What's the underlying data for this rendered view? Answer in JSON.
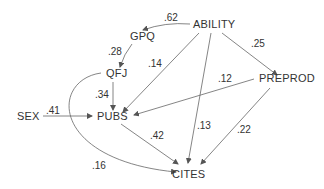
{
  "diagram": {
    "type": "path-diagram",
    "nodes": [
      {
        "id": "ability",
        "label": "ABILITY"
      },
      {
        "id": "gpq",
        "label": "GPQ"
      },
      {
        "id": "qfj",
        "label": "QFJ"
      },
      {
        "id": "preprod",
        "label": "PREPROD"
      },
      {
        "id": "sex",
        "label": "SEX"
      },
      {
        "id": "pubs",
        "label": "PUBS"
      },
      {
        "id": "cites",
        "label": "CITES"
      }
    ],
    "edges": [
      {
        "from": "ABILITY",
        "to": "GPQ",
        "coef": ".62"
      },
      {
        "from": "GPQ",
        "to": "QFJ",
        "coef": ".28"
      },
      {
        "from": "ABILITY",
        "to": "PUBS",
        "coef": ".14"
      },
      {
        "from": "ABILITY",
        "to": "PREPROD",
        "coef": ".25"
      },
      {
        "from": "QFJ",
        "to": "PUBS",
        "coef": ".34"
      },
      {
        "from": "PREPROD",
        "to": "PUBS",
        "coef": ".12"
      },
      {
        "from": "SEX",
        "to": "PUBS",
        "coef": ".41"
      },
      {
        "from": "ABILITY",
        "to": "CITES",
        "coef": ".13"
      },
      {
        "from": "PUBS",
        "to": "CITES",
        "coef": ".42"
      },
      {
        "from": "PREPROD",
        "to": "CITES",
        "coef": ".22"
      },
      {
        "from": "QFJ",
        "to": "CITES",
        "coef": ".16"
      }
    ]
  }
}
